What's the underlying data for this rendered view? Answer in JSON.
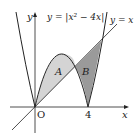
{
  "figure": {
    "curve_label": "y = |x² − 4x|",
    "line_label": "y = x",
    "axis_x_label": "x",
    "axis_y_label": "y",
    "origin_label": "O",
    "tick_4_label": "4",
    "region_a_label": "A",
    "region_b_label": "B"
  },
  "colors": {
    "stroke": "#222222",
    "region_a_fill": "#d4d4d4",
    "region_b_fill": "#9a9a9a",
    "background": "#ffffff"
  },
  "math": {
    "curve": "y = |x^2 - 4x|",
    "line": "y = x",
    "intersections_x": [
      0,
      3,
      5
    ],
    "region_A": "between curve (hump) and line, 0 <= x <= 3",
    "region_B": "between line and curve, 3 <= x <= 5"
  }
}
